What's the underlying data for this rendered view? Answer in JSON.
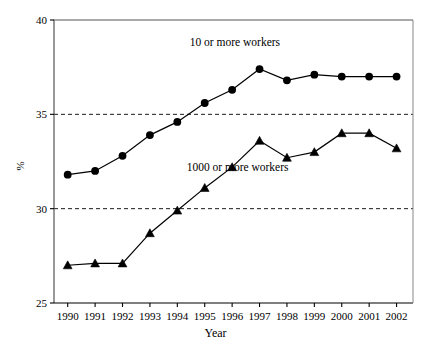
{
  "chart_data": {
    "type": "line",
    "title": "",
    "xlabel": "Year",
    "ylabel": "%",
    "x": [
      1990,
      1991,
      1992,
      1993,
      1994,
      1995,
      1996,
      1997,
      1998,
      1999,
      2000,
      2001,
      2002
    ],
    "categories": [
      "1990",
      "1991",
      "1992",
      "1993",
      "1994",
      "1995",
      "1996",
      "1997",
      "1998",
      "1999",
      "2000",
      "2001",
      "2002"
    ],
    "xlim": [
      1989.5,
      2002.6
    ],
    "ylim": [
      25,
      40
    ],
    "yticks": [
      25,
      30,
      35,
      40
    ],
    "ytick_labels": [
      "25",
      "30",
      "35",
      "40"
    ],
    "xticks": [
      1990,
      1991,
      1992,
      1993,
      1994,
      1995,
      1996,
      1997,
      1998,
      1999,
      2000,
      2001,
      2002
    ],
    "grid": "horizontal dashed at 30 and 35",
    "gridlines": [
      30,
      35
    ],
    "legend_position": "inline annotations next to each series",
    "series": [
      {
        "name": "10 or more workers",
        "marker": "circle",
        "color": "#000000",
        "label_x": 1996.1,
        "label_y": 38.6,
        "values": [
          31.8,
          32.0,
          32.8,
          33.9,
          34.6,
          35.6,
          36.3,
          37.4,
          36.8,
          37.1,
          37.0,
          37.0,
          37.0
        ]
      },
      {
        "name": "1000 or more workers",
        "marker": "triangle",
        "color": "#000000",
        "label_x": 1996.2,
        "label_y": 32.0,
        "values": [
          27.0,
          27.1,
          27.1,
          28.7,
          29.9,
          31.1,
          32.2,
          33.6,
          32.7,
          33.0,
          34.0,
          34.0,
          33.2
        ]
      }
    ]
  },
  "axis": {
    "y_title": "%",
    "x_title": "Year"
  }
}
